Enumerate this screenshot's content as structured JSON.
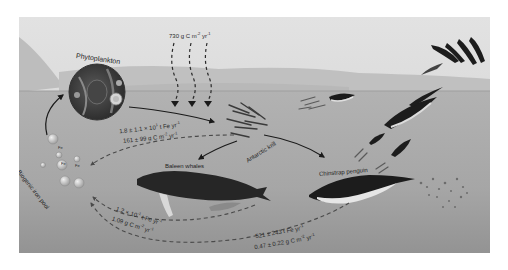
{
  "figure": {
    "colors": {
      "background": "#ffffff",
      "sky": "#d8d8d8",
      "distant_ice": "#c4c4c4",
      "sea_surface": "#b4b4b4",
      "water": "#a9a9a9",
      "deep_water": "#9a9a9a",
      "arrow_solid": "#1a1a1a",
      "arrow_dashed": "#4a4a4a",
      "animal_dark": "#1c1c1c",
      "animal_light": "#e8e8e8"
    }
  },
  "nodes": {
    "phytoplankton": {
      "label": "Phytoplankton"
    },
    "krill": {
      "label": "Antarctic krill"
    },
    "whales": {
      "label": "Baleen whales"
    },
    "penguin": {
      "label": "Chinstrap penguin"
    },
    "iron_pool": {
      "label": "Biogenic iron pool",
      "particle_label": "Fe"
    }
  },
  "fluxes": {
    "primary_production": {
      "value": "730 g C m",
      "exp1": "-2",
      "unit": " yr",
      "exp2": "-1"
    },
    "krill_fe": {
      "value": "1.8 ± 1.1 × 10",
      "exp1": "1",
      "unit": " t Fe yr",
      "exp2": "-1"
    },
    "krill_c": {
      "value": "161 ± 99 g C m",
      "exp1": "-2",
      "unit": " yr",
      "exp2": "-1"
    },
    "whale_fe": {
      "value": "1.2 × 10",
      "exp1": "-1",
      "unit": " t Fe yr",
      "exp2": "-1"
    },
    "whale_c": {
      "value": "1.09 g C m",
      "exp1": "-2",
      "unit": " yr",
      "exp2": "-1"
    },
    "penguin_fe": {
      "value": "521 ± 243 t Fe yr",
      "exp1": "-1"
    },
    "penguin_c": {
      "value": "0.47 ± 0.22 g C m",
      "exp1": "-2",
      "unit": " yr",
      "exp2": "-1"
    }
  },
  "icons": {
    "sunlight_arrows": "dashed-down-arrows",
    "phytoplankton_cell": "microscope-circle",
    "krill_swarm": "krill-icon",
    "whale": "whale-icon",
    "penguin": "penguin-icon",
    "iron_particles": "fe-bubble-icon"
  }
}
